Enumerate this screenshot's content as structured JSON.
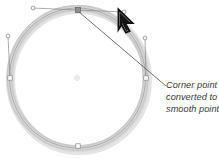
{
  "figure": {
    "title": "Corner point converted to a smooth point",
    "caption": {
      "lines": [
        "Corner point",
        "converted to a",
        "smooth point"
      ]
    },
    "colors": {
      "path_stroke": "#c9c9c9",
      "path_shadow": "#dcdcdc",
      "thin_path": "#9a9a9a",
      "handle_line": "#8a8a8a",
      "anchor_fill": "#ffffff",
      "anchor_stroke": "#7a7a7a",
      "selected_anchor": "#6e6e6e",
      "leader_line": "#5a5a5a",
      "cursor": "#1a1a1a",
      "caption_text": "#3a3a3a",
      "background": "#ffffff"
    },
    "shape": {
      "name": "circle-path",
      "type": "closed-bezier-circle",
      "center": {
        "x": 77,
        "y": 78
      },
      "radius_x": 68,
      "radius_y": 70,
      "stroke_width": 6
    },
    "anchors": [
      {
        "name": "anchor-top",
        "x": 78,
        "y": 10,
        "state": "selected-smooth"
      },
      {
        "name": "anchor-left",
        "x": 10,
        "y": 78,
        "state": "normal"
      },
      {
        "name": "anchor-right",
        "x": 146,
        "y": 78,
        "state": "normal"
      },
      {
        "name": "anchor-bottom",
        "x": 78,
        "y": 146,
        "state": "normal"
      }
    ],
    "handles": [
      {
        "name": "handle-top-left",
        "from_x": 78,
        "from_y": 10,
        "to_x": 33,
        "to_y": 8
      },
      {
        "name": "handle-top-right",
        "from_x": 78,
        "from_y": 10,
        "to_x": 124,
        "to_y": 12
      },
      {
        "name": "handle-left-up",
        "from_x": 10,
        "from_y": 78,
        "to_x": 8,
        "to_y": 36
      },
      {
        "name": "handle-right-up",
        "from_x": 146,
        "from_y": 78,
        "to_x": 145,
        "to_y": 38
      }
    ],
    "center_point": {
      "name": "center-marker",
      "x": 77,
      "y": 78
    },
    "leader": {
      "name": "leader-line",
      "from_x": 79,
      "from_y": 12,
      "to_x": 166,
      "to_y": 86
    },
    "cursor": {
      "name": "arrow-cursor",
      "x": 118,
      "y": 8,
      "label": "arrow-pointer-icon"
    }
  }
}
